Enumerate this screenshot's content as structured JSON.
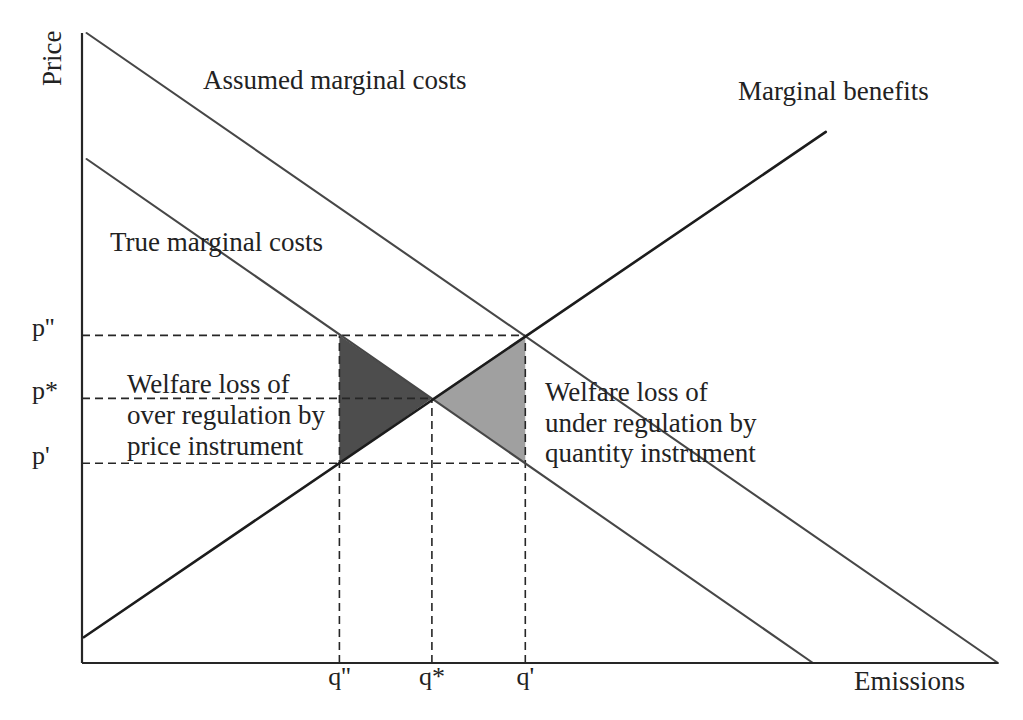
{
  "chart_data": {
    "type": "line",
    "title": "",
    "xlabel": "Emissions",
    "ylabel": "Price",
    "xlim": [
      0,
      100
    ],
    "ylim": [
      0,
      100
    ],
    "grid": false,
    "legend": null,
    "series": [
      {
        "name": "Assumed marginal costs",
        "points": [
          [
            0.5,
            100
          ],
          [
            100,
            0
          ]
        ],
        "color": "#474747"
      },
      {
        "name": "True marginal costs",
        "points": [
          [
            0.5,
            80
          ],
          [
            79.8,
            0
          ]
        ],
        "color": "#474747"
      },
      {
        "name": "Marginal benefits",
        "points": [
          [
            0.2,
            4.1
          ],
          [
            81.2,
            84.3
          ]
        ],
        "color": "#1c1c1c"
      }
    ],
    "x_ticks": [
      {
        "label": "q''",
        "value": 28.1
      },
      {
        "label": "q*",
        "value": 38.2
      },
      {
        "label": "q'",
        "value": 48.4
      }
    ],
    "y_ticks": [
      {
        "label": "p''",
        "value": 52.0
      },
      {
        "label": "p*",
        "value": 42.0
      },
      {
        "label": "p'",
        "value": 31.7
      }
    ],
    "reference_lines": [
      {
        "name": "p-double-prime-guide",
        "points": [
          [
            0,
            52.0
          ],
          [
            48.4,
            52.0
          ]
        ]
      },
      {
        "name": "p-star-guide",
        "points": [
          [
            0,
            42.0
          ],
          [
            38.2,
            42.0
          ]
        ]
      },
      {
        "name": "p-prime-guide",
        "points": [
          [
            0,
            31.7
          ],
          [
            48.4,
            31.7
          ]
        ]
      },
      {
        "name": "q-double-prime-guide",
        "points": [
          [
            28.1,
            0
          ],
          [
            28.1,
            52.0
          ]
        ]
      },
      {
        "name": "q-star-guide",
        "points": [
          [
            38.2,
            0
          ],
          [
            38.2,
            42.0
          ]
        ]
      },
      {
        "name": "q-prime-guide",
        "points": [
          [
            48.4,
            0
          ],
          [
            48.4,
            52.0
          ]
        ]
      }
    ],
    "shaded_areas": [
      {
        "name": "Welfare loss of over regulation by price instrument",
        "points": [
          [
            28.1,
            52.0
          ],
          [
            38.2,
            42.0
          ],
          [
            28.1,
            31.7
          ]
        ],
        "color": "#4d4d4d"
      },
      {
        "name": "Welfare loss of under regulation by quantity instrument",
        "points": [
          [
            38.2,
            42.0
          ],
          [
            48.4,
            52.0
          ],
          [
            48.4,
            31.7
          ]
        ],
        "color": "#a0a0a0"
      }
    ],
    "annotations": [
      {
        "lines": [
          "Welfare loss of",
          "over regulation by",
          "price instrument"
        ],
        "refers_to": "dark shaded triangle"
      },
      {
        "lines": [
          "Welfare loss of",
          "under regulation by",
          "quantity instrument"
        ],
        "refers_to": "light shaded triangle"
      }
    ]
  }
}
